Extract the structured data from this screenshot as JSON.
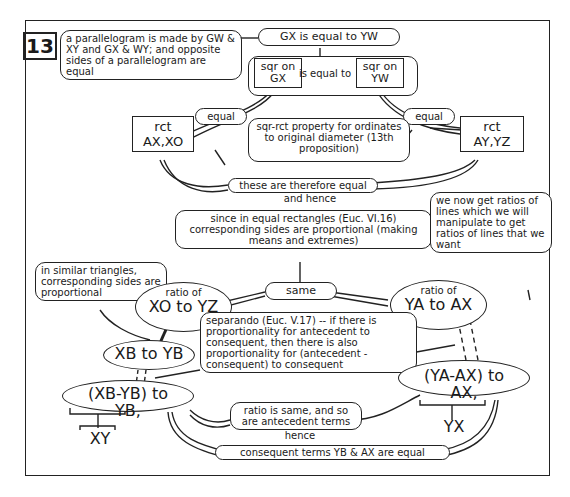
{
  "proposition_number": "13",
  "nodes": {
    "parallelogram": "a parallelogram is made by GW & XY and GX & WY; and opposite sides of a parallelogram are equal",
    "gx_equal_yw": "GX is equal to YW",
    "sqr_gx": "sqr on GX",
    "is_equal_to": "is equal to",
    "sqr_yw": "sqr on YW",
    "equal_left": "equal",
    "equal_right": "equal",
    "rct_ax_xo": "rct AX,XO",
    "rct_ay_yz": "rct AY,YZ",
    "sqr_rct_property": "sqr-rct property for ordinates to original diameter (13th proposition)",
    "therefore_equal": "these are therefore equal",
    "and_hence": "and hence",
    "since_equal_rect": "since in equal rectangles (Euc. VI.16) corresponding sides are proportional (making means and extremes)",
    "ratios_note": "we now get ratios of lines which we will manipulate to get ratios of lines that we want",
    "similar_triangles": "in similar triangles, corresponding sides are proportional",
    "same": "same",
    "ratio_xo_yz_label": "ratio of",
    "ratio_xo_yz": "XO to YZ",
    "ratio_ya_ax_label": "ratio of",
    "ratio_ya_ax": "YA to AX",
    "xb_yb": "XB to YB",
    "separando": "separando (Euc. V.17) -- if there is proportionality for antecedent to consequent, then there is also proportionality for (antecedent - consequent) to consequent",
    "xb_minus_yb": "(XB-YB) to YB,",
    "ya_minus_ax": "(YA-AX) to AX,",
    "xy": "XY",
    "yx": "YX",
    "ratio_same": "ratio is same, and so are antecedent terms",
    "hence": "hence",
    "consequent_equal": "consequent terms YB & AX are equal"
  }
}
